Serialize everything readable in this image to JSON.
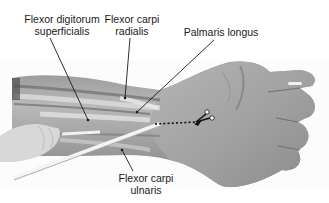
{
  "figure": {
    "labels": [
      {
        "id": "fds",
        "lines": [
          "Flexor digitorum",
          "superficialis"
        ]
      },
      {
        "id": "fcr",
        "lines": [
          "Flexor carpi",
          "radialis"
        ]
      },
      {
        "id": "pl",
        "lines": [
          "Palmaris longus"
        ]
      },
      {
        "id": "fcu",
        "lines": [
          "Flexor carpi",
          "ulnaris"
        ]
      }
    ],
    "annotations": {
      "incision_line": "dotted",
      "cut_marker_icon": "scissors-icon"
    },
    "colors": {
      "background": "#ffffff",
      "text": "#1a1a1a",
      "leader_line": "#1a1a1a",
      "skin_mid": "#a8a8a8",
      "skin_light": "#c9c9c9",
      "tendon": "#e0e0e0",
      "glove": "#d8d8d8"
    }
  }
}
